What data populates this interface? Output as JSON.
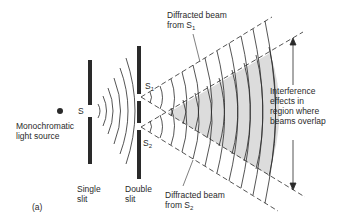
{
  "diagram": {
    "panel_label": "(a)",
    "labels": {
      "source": [
        "Monochromatic",
        "light source"
      ],
      "single_slit_gap": "S",
      "single_slit": [
        "Single",
        "slit"
      ],
      "double_slit": [
        "Double",
        "slit"
      ],
      "slit1": "S",
      "slit1_sub": "1",
      "slit2": "S",
      "slit2_sub": "2",
      "beam1": [
        "Diffracted beam",
        "from S"
      ],
      "beam1_sub": "1",
      "beam2": [
        "Diffracted beam",
        "from S"
      ],
      "beam2_sub": "2",
      "interference": [
        "Interference",
        "effects in",
        "region where",
        "beams overlap"
      ]
    },
    "colors": {
      "ink": "#2a2a2a",
      "overlap_fill": "#dcdcdc",
      "background": "#ffffff"
    }
  }
}
